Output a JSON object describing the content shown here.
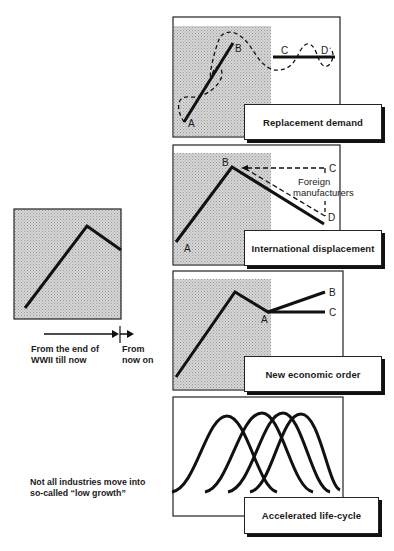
{
  "colors": {
    "ink": "#1a1a1a",
    "shade": "#c8c8c8",
    "paper": "#ffffff"
  },
  "left_panel": {
    "timeline_past": "From the end of\nWWII till now",
    "timeline_past_line1": "From the end of",
    "timeline_past_line2": "WWII till now",
    "timeline_future_line1": "From",
    "timeline_future_line2": "now on",
    "note_line1": "Not all industries move into",
    "note_line2": "so-called “low growth”"
  },
  "panels": [
    {
      "title": "Replacement demand",
      "points": [
        "A",
        "B",
        "C",
        "D"
      ]
    },
    {
      "title": "International displacement",
      "points": [
        "A",
        "B",
        "C",
        "D"
      ],
      "annotation_line1": "Foreign",
      "annotation_line2": "manufacturers"
    },
    {
      "title": "New economic order",
      "points": [
        "A",
        "B",
        "C"
      ]
    },
    {
      "title": "Accelerated life-cycle",
      "curve_count": 4
    }
  ]
}
